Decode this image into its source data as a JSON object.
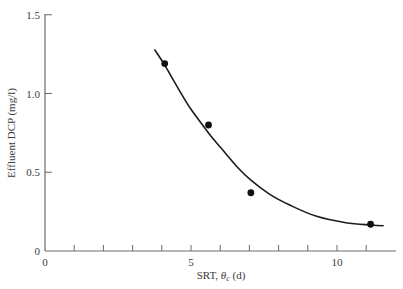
{
  "chart_data": {
    "type": "scatter",
    "title": "",
    "xlabel": "SRT, θc (d)",
    "xlabel_main": "SRT, ",
    "xlabel_symbol": "θ",
    "xlabel_sub": "c",
    "xlabel_unit": " (d)",
    "ylabel": "Effluent DCP (mg/l)",
    "xlim": [
      0,
      12
    ],
    "ylim": [
      0,
      1.5
    ],
    "x_major_ticks": [
      0,
      5,
      10
    ],
    "x_minor_ticks": [
      1,
      2,
      3,
      4,
      6,
      7,
      8,
      9,
      11
    ],
    "x_tick_labels": [
      "0",
      "5",
      "10"
    ],
    "y_ticks": [
      0,
      0.5,
      1.0,
      1.5
    ],
    "y_tick_labels": [
      "0",
      "0.5",
      "1.0",
      "1.5"
    ],
    "grid": false,
    "legend": null,
    "series": [
      {
        "name": "Observed",
        "type": "scatter",
        "x": [
          4.1,
          5.6,
          7.05,
          11.15
        ],
        "y": [
          1.19,
          0.8,
          0.37,
          0.17
        ]
      },
      {
        "name": "Model fit",
        "type": "line",
        "x": [
          3.75,
          4.1,
          4.6,
          5.0,
          5.6,
          6.0,
          6.6,
          7.05,
          7.7,
          8.4,
          9.3,
          10.3,
          11.15,
          11.6
        ],
        "y": [
          1.28,
          1.18,
          1.02,
          0.9,
          0.75,
          0.66,
          0.53,
          0.45,
          0.36,
          0.29,
          0.22,
          0.18,
          0.165,
          0.16
        ]
      }
    ]
  }
}
